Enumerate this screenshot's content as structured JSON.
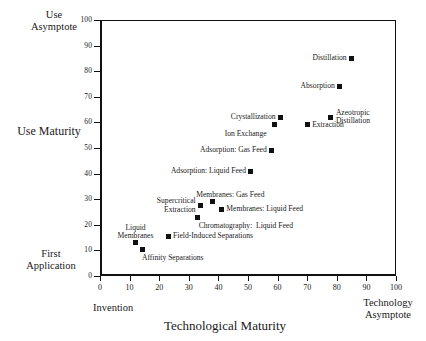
{
  "chart_data": {
    "type": "scatter",
    "title": "",
    "xlabel": "Technological Maturity",
    "ylabel": "Use Maturity",
    "xlim": [
      0,
      100
    ],
    "ylim": [
      0,
      100
    ],
    "xticks": [
      0,
      10,
      20,
      30,
      40,
      50,
      60,
      70,
      80,
      90,
      100
    ],
    "yticks": [
      0,
      10,
      20,
      30,
      40,
      50,
      60,
      70,
      80,
      90,
      100
    ],
    "grid": false,
    "legend": "none",
    "axis_captions": {
      "y_top": "Use\nAsymptote",
      "y_bottom": "First\nApplication",
      "x_left": "Invention",
      "x_right": "Technology\nAsymptote"
    },
    "points": [
      {
        "label": "Distillation",
        "x": 85,
        "y": 85,
        "label_pos": "left"
      },
      {
        "label": "Absorption",
        "x": 81,
        "y": 74,
        "label_pos": "left"
      },
      {
        "label": "Azeotropic\nDistillation",
        "x": 78,
        "y": 62,
        "label_pos": "right"
      },
      {
        "label": "Crystallization",
        "x": 61,
        "y": 62,
        "label_pos": "left"
      },
      {
        "label": "Extraction",
        "x": 70,
        "y": 59,
        "label_pos": "right"
      },
      {
        "label": "Ion Exchange",
        "x": 59,
        "y": 59,
        "label_pos": "below-left"
      },
      {
        "label": "Adsorption: Gas Feed",
        "x": 58,
        "y": 49,
        "label_pos": "left"
      },
      {
        "label": "Adsorption: Liquid Feed",
        "x": 51,
        "y": 41,
        "label_pos": "left"
      },
      {
        "label": "Membranes: Gas Feed",
        "x": 38,
        "y": 29,
        "label_pos": "above-right"
      },
      {
        "label": "Supercritical\nExtraction",
        "x": 34,
        "y": 27.5,
        "label_pos": "left"
      },
      {
        "label": "Membranes: Liquid Feed",
        "x": 41,
        "y": 26,
        "label_pos": "right"
      },
      {
        "label": "Chromatography:  Liquid Feed",
        "x": 33,
        "y": 23,
        "label_pos": "below-right"
      },
      {
        "label": "Field-Induced Separations",
        "x": 23,
        "y": 15.5,
        "label_pos": "right"
      },
      {
        "label": "Liquid\nMembranes",
        "x": 12,
        "y": 13,
        "label_pos": "above-left"
      },
      {
        "label": "Affinity Separations",
        "x": 14.5,
        "y": 10.5,
        "label_pos": "below"
      }
    ],
    "colors": {
      "marker": "#111111",
      "axis": "#111111",
      "background": "#ffffff",
      "text": "#1a1a1a"
    }
  }
}
